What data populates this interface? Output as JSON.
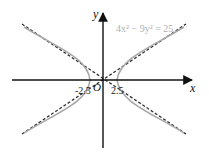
{
  "diagram": {
    "equation_label": "4x² − 9y² = 25",
    "axis_labels": {
      "x": "x",
      "y": "y",
      "origin": "O"
    },
    "vertex_labels": {
      "left": "-2.5",
      "right": "2.5"
    },
    "curve": {
      "type": "hyperbola",
      "a": 2.5,
      "b": 1.6667,
      "color": "#a8a8a8"
    },
    "asymptotes": {
      "equations": [
        "y = 2x/3",
        "y = -2x/3"
      ],
      "style": "dashed",
      "color": "#333333"
    },
    "colors": {
      "axes": "#111111",
      "curve": "#a8a8a8",
      "asymptote": "#333333",
      "equation_text": "#b0b0b0"
    }
  }
}
